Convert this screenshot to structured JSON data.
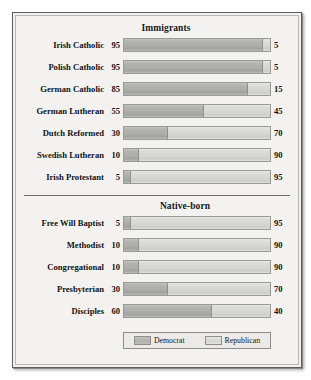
{
  "chart_data": {
    "type": "bar",
    "subtype": "stacked-horizontal-100pct",
    "title": "",
    "xlabel": "",
    "ylabel": "",
    "xlim": [
      0,
      100
    ],
    "grid": false,
    "legend_position": "bottom",
    "legend": [
      {
        "name": "Democrat",
        "color": "#b0b0ad"
      },
      {
        "name": "Republican",
        "color": "#d9d9d7"
      }
    ],
    "series": [
      {
        "name": "Democrat",
        "values": [
          95,
          95,
          85,
          55,
          30,
          10,
          5,
          5,
          10,
          10,
          30,
          60
        ]
      },
      {
        "name": "Republican",
        "values": [
          5,
          5,
          15,
          45,
          70,
          90,
          95,
          95,
          90,
          90,
          70,
          40
        ]
      }
    ],
    "categories": [
      "Irish Catholic",
      "Polish Catholic",
      "German Catholic",
      "German Lutheran",
      "Dutch Reformed",
      "Swedish Lutheran",
      "Irish Protestant",
      "Free Will Baptist",
      "Methodist",
      "Congregational",
      "Presbyterian",
      "Disciples"
    ],
    "panels": [
      {
        "title": "Immigrants",
        "rows": [
          {
            "label": "Irish Catholic",
            "democrat": 95,
            "republican": 5
          },
          {
            "label": "Polish Catholic",
            "democrat": 95,
            "republican": 5
          },
          {
            "label": "German Catholic",
            "democrat": 85,
            "republican": 15
          },
          {
            "label": "German Lutheran",
            "democrat": 55,
            "republican": 45
          },
          {
            "label": "Dutch Reformed",
            "democrat": 30,
            "republican": 70
          },
          {
            "label": "Swedish Lutheran",
            "democrat": 10,
            "republican": 90
          },
          {
            "label": "Irish Protestant",
            "democrat": 5,
            "republican": 95
          }
        ]
      },
      {
        "title": "Native-born",
        "rows": [
          {
            "label": "Free Will Baptist",
            "democrat": 5,
            "republican": 95
          },
          {
            "label": "Methodist",
            "democrat": 10,
            "republican": 90
          },
          {
            "label": "Congregational",
            "democrat": 10,
            "republican": 90
          },
          {
            "label": "Presbyterian",
            "democrat": 30,
            "republican": 70
          },
          {
            "label": "Disciples",
            "democrat": 60,
            "republican": 40
          }
        ]
      }
    ]
  },
  "legend": {
    "democrat_label": "Democrat",
    "republican_label": "Republican"
  },
  "colors": {
    "democrat": "#b0b0ad",
    "republican": "#d9d9d7",
    "background": "#f3f2f0",
    "frame": "#5d5d5d",
    "text": "#121315"
  }
}
